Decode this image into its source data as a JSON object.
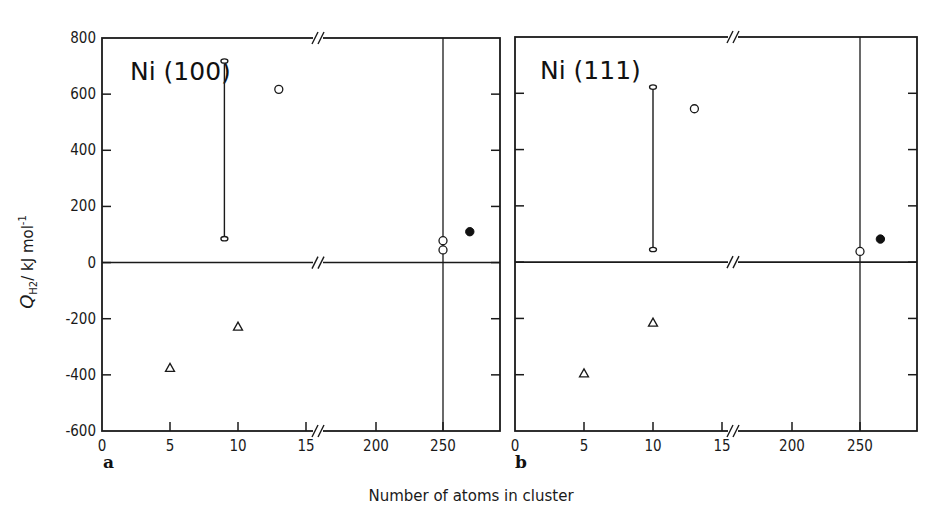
{
  "figure": {
    "xlabel": "Number of atoms in cluster",
    "ylabel_main": "Q",
    "ylabel_sub": "H2",
    "ylabel_units": "/ kJ mol",
    "ylabel_exp": "-1"
  },
  "chart_data": [
    {
      "type": "scatter",
      "panel": "a",
      "title": "Ni (100)",
      "xlabel": "Number of atoms in cluster",
      "ylabel": "Q_H2 / kJ mol^-1",
      "ylim": [
        -600,
        800
      ],
      "yticks": [
        800,
        600,
        400,
        200,
        0,
        -200,
        -400,
        -600
      ],
      "xticks": [
        0,
        5,
        10,
        15,
        200,
        250
      ],
      "x_axis_break": "between 15 and 200",
      "vertical_reference_line_x": 250,
      "horizontal_reference_line_y": 0,
      "series": [
        {
          "name": "range (open ends)",
          "marker": "bar",
          "points": [
            {
              "x": 9,
              "ymin": 85,
              "ymax": 718
            }
          ]
        },
        {
          "name": "open circles",
          "marker": "circle-open",
          "points": [
            {
              "x": 13,
              "y": 617
            },
            {
              "x": 250,
              "y": 78
            },
            {
              "x": 250,
              "y": 45
            }
          ]
        },
        {
          "name": "filled circle",
          "marker": "circle-filled",
          "points": [
            {
              "x": 270,
              "y": 110
            }
          ]
        },
        {
          "name": "triangles",
          "marker": "triangle-open",
          "points": [
            {
              "x": 5,
              "y": -375
            },
            {
              "x": 10,
              "y": -228
            }
          ]
        }
      ]
    },
    {
      "type": "scatter",
      "panel": "b",
      "title": "Ni (111)",
      "xlabel": "Number of atoms in cluster",
      "ylabel": "Q_H2 / kJ mol^-1",
      "ylim": [
        -600,
        800
      ],
      "yticks": [
        800,
        600,
        400,
        200,
        0,
        -200,
        -400,
        -600
      ],
      "xticks": [
        0,
        5,
        10,
        15,
        200,
        250
      ],
      "x_axis_break": "between 15 and 200",
      "vertical_reference_line_x": 250,
      "horizontal_reference_line_y": 0,
      "series": [
        {
          "name": "range (open ends)",
          "marker": "bar",
          "points": [
            {
              "x": 10,
              "ymin": 45,
              "ymax": 622
            }
          ]
        },
        {
          "name": "open circles",
          "marker": "circle-open",
          "points": [
            {
              "x": 13,
              "y": 545
            },
            {
              "x": 250,
              "y": 38
            }
          ]
        },
        {
          "name": "filled circle",
          "marker": "circle-filled",
          "points": [
            {
              "x": 265,
              "y": 82
            }
          ]
        },
        {
          "name": "triangles",
          "marker": "triangle-open",
          "points": [
            {
              "x": 5,
              "y": -395
            },
            {
              "x": 10,
              "y": -215
            }
          ]
        }
      ]
    }
  ],
  "panels": {
    "a": {
      "title": "Ni (100)",
      "letter": "a",
      "yticks": [
        "800",
        "600",
        "400",
        "200",
        "0",
        "-200",
        "-400",
        "-600"
      ],
      "xticks": [
        "0",
        "5",
        "10",
        "15",
        "200",
        "250"
      ]
    },
    "b": {
      "title": "Ni (111)",
      "letter": "b",
      "xticks": [
        "0",
        "5",
        "10",
        "15",
        "200",
        "250"
      ]
    }
  }
}
